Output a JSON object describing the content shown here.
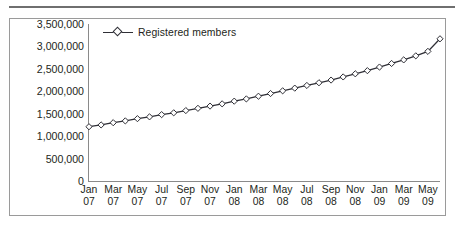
{
  "figure": {
    "frame_color": "#9a9a9a",
    "rule_color": "#6f6f6f",
    "series_color": "#2f2f36",
    "marker_fill": "#ffffff"
  },
  "legend": {
    "position": "top-left-inside",
    "entries": [
      {
        "label": "Registered members",
        "marker": "diamond-open",
        "color": "#2f2f36"
      }
    ]
  },
  "chart_data": {
    "type": "line",
    "title": "",
    "subtitle": "",
    "xlabel": "",
    "ylabel": "",
    "grid": false,
    "legend_position": "top-left-inside",
    "ylim": [
      0,
      3500000
    ],
    "yticks": [
      0,
      500000,
      1000000,
      1500000,
      2000000,
      2500000,
      3000000,
      3500000
    ],
    "ytick_labels": [
      "0",
      "500,000",
      "1,000,000",
      "1,500,000",
      "2,000,000",
      "2,500,000",
      "3,000,000",
      "3,500,000"
    ],
    "xtick_labels": [
      {
        "month": "Jan",
        "year": "07"
      },
      {
        "month": "Mar",
        "year": "07"
      },
      {
        "month": "May",
        "year": "07"
      },
      {
        "month": "Jul",
        "year": "07"
      },
      {
        "month": "Sep",
        "year": "07"
      },
      {
        "month": "Nov",
        "year": "07"
      },
      {
        "month": "Jan",
        "year": "08"
      },
      {
        "month": "Mar",
        "year": "08"
      },
      {
        "month": "May",
        "year": "08"
      },
      {
        "month": "Jul",
        "year": "08"
      },
      {
        "month": "Sep",
        "year": "08"
      },
      {
        "month": "Nov",
        "year": "08"
      },
      {
        "month": "Jan",
        "year": "09"
      },
      {
        "month": "Mar",
        "year": "09"
      },
      {
        "month": "May",
        "year": "09"
      }
    ],
    "x": [
      "Jan 07",
      "Feb 07",
      "Mar 07",
      "Apr 07",
      "May 07",
      "Jun 07",
      "Jul 07",
      "Aug 07",
      "Sep 07",
      "Oct 07",
      "Nov 07",
      "Dec 07",
      "Jan 08",
      "Feb 08",
      "Mar 08",
      "Apr 08",
      "May 08",
      "Jun 08",
      "Jul 08",
      "Aug 08",
      "Sep 08",
      "Oct 08",
      "Nov 08",
      "Dec 08",
      "Jan 09",
      "Feb 09",
      "Mar 09",
      "Apr 09",
      "May 09",
      "Jun 09"
    ],
    "series": [
      {
        "name": "Registered members",
        "marker": "diamond-open",
        "color": "#2f2f36",
        "values": [
          1210000,
          1250000,
          1300000,
          1340000,
          1390000,
          1430000,
          1480000,
          1520000,
          1570000,
          1620000,
          1670000,
          1720000,
          1780000,
          1830000,
          1890000,
          1950000,
          2010000,
          2070000,
          2130000,
          2190000,
          2250000,
          2320000,
          2390000,
          2460000,
          2540000,
          2620000,
          2700000,
          2790000,
          2890000,
          3170000
        ]
      }
    ]
  }
}
